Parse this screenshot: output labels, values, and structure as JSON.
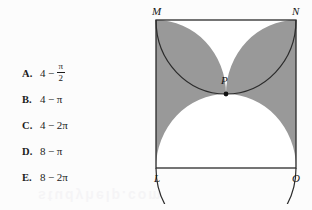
{
  "question": {
    "choices": [
      {
        "letter": "A.",
        "left": "4",
        "op": "−",
        "kind": "fraction",
        "num": "π",
        "den": "2",
        "text": "4 − π/2"
      },
      {
        "letter": "B.",
        "left": "4",
        "op": "−",
        "kind": "plain",
        "right": "π",
        "text": "4 − π"
      },
      {
        "letter": "C.",
        "left": "4",
        "op": "−",
        "kind": "plain",
        "right": "2π",
        "text": "4 − 2π"
      },
      {
        "letter": "D.",
        "left": "8",
        "op": "−",
        "kind": "plain",
        "right": "π",
        "text": "8 − π"
      },
      {
        "letter": "E.",
        "left": "8",
        "op": "−",
        "kind": "plain",
        "right": "2π",
        "text": "8 − 2π"
      }
    ]
  },
  "figure": {
    "type": "geometry-diagram",
    "vertex_labels": {
      "top_left": "M",
      "top_right": "N",
      "bottom_left": "L",
      "bottom_right": "O",
      "center": "P"
    },
    "shaded_regions": 2,
    "colors": {
      "shading": "#999999",
      "stroke": "#2b2b2b",
      "fill": "#ffffff",
      "background": "#fcfcfc",
      "point": "#111111"
    }
  },
  "watermark": {
    "text": "studyhelp.com"
  }
}
